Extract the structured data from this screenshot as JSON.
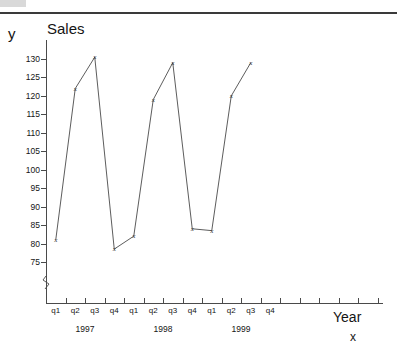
{
  "chart_data": {
    "type": "line",
    "title": "Sales",
    "xlabel": "Year",
    "ylabel": "y",
    "x_axis_variable": "x",
    "categories": [
      "q1",
      "q2",
      "q3",
      "q4",
      "q1",
      "q2",
      "q3",
      "q4",
      "q1",
      "q2",
      "q3",
      "q4"
    ],
    "group_labels": [
      "1997",
      "1998",
      "1999"
    ],
    "values": [
      81,
      122,
      130.5,
      78.5,
      82,
      119,
      129,
      84,
      83.5,
      120,
      129,
      null
    ],
    "points": [
      {
        "period": "1997 q1",
        "value": 81
      },
      {
        "period": "1997 q2",
        "value": 122
      },
      {
        "period": "1997 q3",
        "value": 130.5
      },
      {
        "period": "1997 q4",
        "value": 78.5
      },
      {
        "period": "1998 q1",
        "value": 82
      },
      {
        "period": "1998 q2",
        "value": 119
      },
      {
        "period": "1998 q3",
        "value": 129
      },
      {
        "period": "1998 q4",
        "value": 84
      },
      {
        "period": "1999 q1",
        "value": 83.5
      },
      {
        "period": "1999 q2",
        "value": 120
      },
      {
        "period": "1999 q3",
        "value": 129
      }
    ],
    "ylim": [
      75,
      130
    ],
    "ytick_labels": [
      "130",
      "125",
      "120",
      "115",
      "110",
      "105",
      "100",
      "95",
      "90",
      "85",
      "80",
      "75"
    ],
    "ytick_values": [
      130,
      125,
      120,
      115,
      110,
      105,
      100,
      95,
      90,
      85,
      80,
      75
    ],
    "y_axis_broken": true,
    "marker": "x",
    "grid": false,
    "legend": "none",
    "line_color": "#4a4a4a",
    "text_color": "#141414",
    "unlabeled_trailing_ticks": 5
  }
}
